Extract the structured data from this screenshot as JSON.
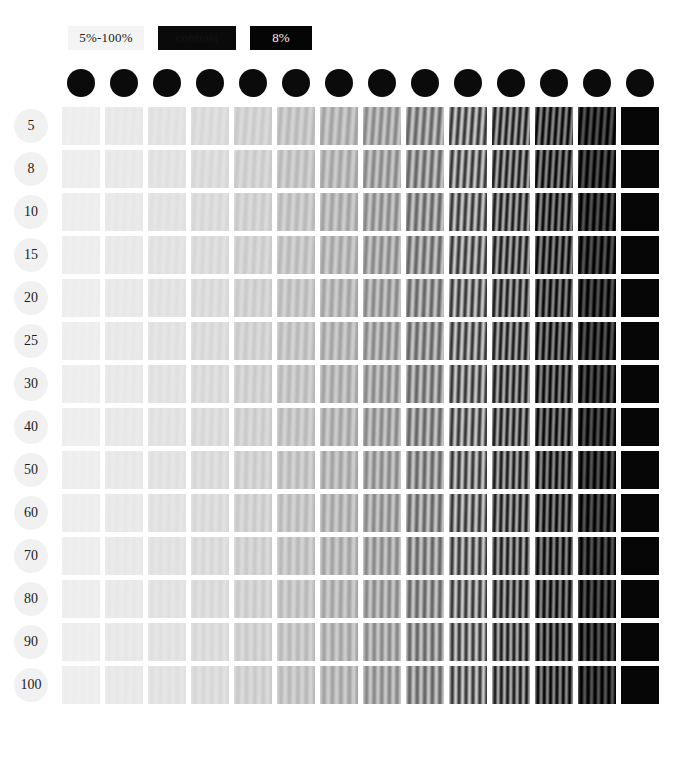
{
  "legend": {
    "range_label": "5%-100%",
    "hidden_label": "contrast",
    "value_label": "8%"
  },
  "matrix": {
    "row_label_header": "",
    "row_labels": [
      "5",
      "8",
      "10",
      "15",
      "20",
      "25",
      "30",
      "40",
      "50",
      "60",
      "70",
      "80",
      "90",
      "100"
    ],
    "column_headers": [
      "",
      "",
      "",
      "",
      "",
      "",
      "",
      "",
      "",
      "",
      "",
      "",
      "",
      ""
    ],
    "column_count": 14,
    "row_count": 14
  },
  "bottom_caption": "",
  "colors": {
    "background": "#ffffff",
    "patch_mean": "#9a9a9a",
    "header_dot": "#0b0b0b",
    "row_dot": "#f1f1f1",
    "legend_dark": "#050505",
    "legend_light": "#f4f4f4"
  },
  "chart_data": {
    "type": "heatmap",
    "title": "",
    "xlabel": "",
    "ylabel": "",
    "row_categories": [
      "5",
      "8",
      "10",
      "15",
      "20",
      "25",
      "30",
      "40",
      "50",
      "60",
      "70",
      "80",
      "90",
      "100"
    ],
    "column_categories": [
      "1",
      "2",
      "3",
      "4",
      "5",
      "6",
      "7",
      "8",
      "9",
      "10",
      "11",
      "12",
      "13",
      "14"
    ],
    "legend_position": "top-left",
    "grid": false,
    "column_mean_luminance": [
      238,
      233,
      227,
      220,
      210,
      198,
      184,
      168,
      150,
      128,
      100,
      72,
      40,
      6
    ],
    "column_contrast_percent": [
      4,
      6,
      8,
      11,
      14,
      18,
      23,
      29,
      36,
      45,
      56,
      70,
      86,
      100
    ],
    "column_grating_cycles": [
      4.5,
      4.5,
      4.5,
      4.5,
      4.5,
      4.5,
      4.5,
      5.0,
      5.0,
      5.5,
      6.0,
      6.0,
      5.5,
      0
    ],
    "row_grating_tilt_deg": [
      4,
      3.5,
      3,
      3,
      2.5,
      2.5,
      2,
      2,
      1.5,
      1.5,
      1,
      1,
      0.5,
      0.5
    ],
    "values": [
      [
        238,
        233,
        227,
        220,
        210,
        198,
        184,
        168,
        150,
        128,
        100,
        72,
        40,
        6
      ],
      [
        238,
        233,
        227,
        220,
        210,
        198,
        184,
        168,
        150,
        128,
        100,
        72,
        40,
        6
      ],
      [
        238,
        233,
        227,
        220,
        210,
        198,
        184,
        168,
        150,
        128,
        100,
        72,
        40,
        6
      ],
      [
        238,
        233,
        227,
        220,
        210,
        198,
        184,
        168,
        150,
        128,
        100,
        72,
        40,
        6
      ],
      [
        238,
        233,
        227,
        220,
        210,
        198,
        184,
        168,
        150,
        128,
        100,
        72,
        40,
        6
      ],
      [
        238,
        233,
        227,
        220,
        210,
        198,
        184,
        168,
        150,
        128,
        100,
        72,
        40,
        6
      ],
      [
        238,
        233,
        227,
        220,
        210,
        198,
        184,
        168,
        150,
        128,
        100,
        72,
        40,
        6
      ],
      [
        238,
        233,
        227,
        220,
        210,
        198,
        184,
        168,
        150,
        128,
        100,
        72,
        40,
        6
      ],
      [
        238,
        233,
        227,
        220,
        210,
        198,
        184,
        168,
        150,
        128,
        100,
        72,
        40,
        6
      ],
      [
        238,
        233,
        227,
        220,
        210,
        198,
        184,
        168,
        150,
        128,
        100,
        72,
        40,
        6
      ],
      [
        238,
        233,
        227,
        220,
        210,
        198,
        184,
        168,
        150,
        128,
        100,
        72,
        40,
        6
      ],
      [
        238,
        233,
        227,
        220,
        210,
        198,
        184,
        168,
        150,
        128,
        100,
        72,
        40,
        6
      ],
      [
        238,
        233,
        227,
        220,
        210,
        198,
        184,
        168,
        150,
        128,
        100,
        72,
        40,
        6
      ],
      [
        238,
        233,
        227,
        220,
        210,
        198,
        184,
        168,
        150,
        128,
        100,
        72,
        40,
        6
      ]
    ]
  }
}
